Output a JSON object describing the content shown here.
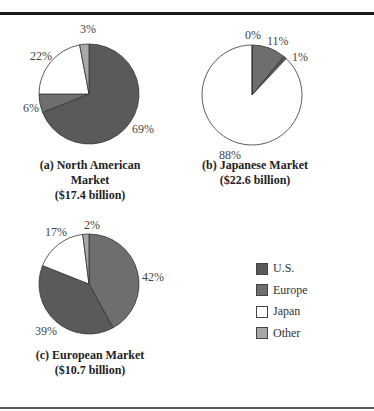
{
  "colors": {
    "U.S.": "#5a5a5a",
    "Europe": "#6e6e6e",
    "Japan": "#ffffff",
    "Other": "#a8a8a8"
  },
  "legend": [
    {
      "label": "U.S.",
      "color": "#5a5a5a"
    },
    {
      "label": "Europe",
      "color": "#6e6e6e"
    },
    {
      "label": "Japan",
      "color": "#ffffff"
    },
    {
      "label": "Other",
      "color": "#a8a8a8"
    }
  ],
  "captions": {
    "a_line1": "(a) North American Market",
    "a_line2": "($17.4 billion)",
    "b_line1": "(b) Japanese Market",
    "b_line2": "($22.6 billion)",
    "c_line1": "(c) European Market",
    "c_line2": "($10.7 billion)"
  },
  "chart_data": [
    {
      "type": "pie",
      "title": "(a) North American Market ($17.4 billion)",
      "categories": [
        "U.S.",
        "Europe",
        "Japan",
        "Other"
      ],
      "values": [
        69,
        6,
        22,
        3
      ],
      "labels": [
        "69%",
        "6%",
        "22%",
        "3%"
      ]
    },
    {
      "type": "pie",
      "title": "(b) Japanese Market ($22.6 billion)",
      "categories": [
        "Europe",
        "U.S.",
        "Japan",
        "Other"
      ],
      "values": [
        11,
        1,
        88,
        0
      ],
      "labels": [
        "11%",
        "1%",
        "88%",
        "0%"
      ]
    },
    {
      "type": "pie",
      "title": "(c) European Market ($10.7 billion)",
      "categories": [
        "Europe",
        "U.S.",
        "Japan",
        "Other"
      ],
      "values": [
        42,
        39,
        17,
        2
      ],
      "labels": [
        "42%",
        "39%",
        "17%",
        "2%"
      ]
    }
  ]
}
